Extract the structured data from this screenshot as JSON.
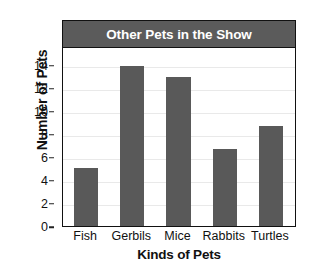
{
  "chart_data": {
    "type": "bar",
    "title": "Other Pets in the Show",
    "xlabel": "Kinds of Pets",
    "ylabel": "Number of Pets",
    "categories": [
      "Fish",
      "Gerbils",
      "Mice",
      "Rabbits",
      "Turtles"
    ],
    "values": [
      5,
      13.9,
      12.9,
      6.7,
      8.7
    ],
    "ylim": [
      0,
      15.5
    ],
    "yticks": [
      0,
      2,
      4,
      6,
      8,
      10,
      12,
      14
    ],
    "ytick_labels": [
      "0",
      "2",
      "4",
      "6",
      "8",
      "10",
      "12",
      "14"
    ],
    "grid": true,
    "legend": false,
    "bar_color": "#595959",
    "gridline_color": "#e9e9e9",
    "title_banner_color": "#5b5b5b",
    "title_text_color": "#ffffff",
    "axis_color": "#111111",
    "plot_background": "#ffffff"
  }
}
